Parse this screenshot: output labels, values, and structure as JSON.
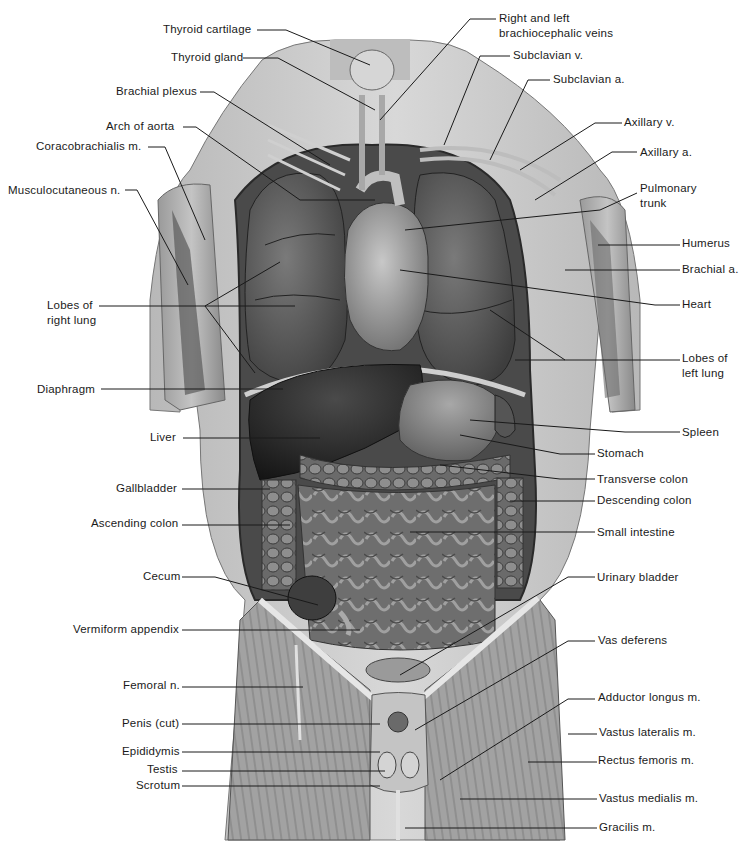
{
  "figure": {
    "type": "anatomical illustration",
    "colors": {
      "background": "#ffffff",
      "skin": "#d4d4d4",
      "muscle": "#8a8a8a",
      "organ_dark": "#3a3a3a",
      "lung": "#5e5e5e",
      "intestine": "#7a7a7a",
      "leader_line": "#1a1a1a",
      "label_text": "#1a1a1a"
    }
  },
  "labels_left": [
    {
      "id": "thyroid-cartilage",
      "text": "Thyroid cartilage",
      "x": 163,
      "y": 24
    },
    {
      "id": "thyroid-gland",
      "text": "Thyroid gland",
      "x": 171,
      "y": 52
    },
    {
      "id": "brachial-plexus",
      "text": "Brachial plexus",
      "x": 116,
      "y": 86
    },
    {
      "id": "arch-of-aorta",
      "text": "Arch of aorta",
      "x": 106,
      "y": 121
    },
    {
      "id": "coracobrachialis",
      "text": "Coracobrachialis m.",
      "x": 36,
      "y": 140
    },
    {
      "id": "musculocutaneous",
      "text": "Musculocutaneous n.",
      "x": 8,
      "y": 184
    },
    {
      "id": "lobes-right-lung",
      "text": "Lobes of\nright lung",
      "x": 47,
      "y": 299
    },
    {
      "id": "diaphragm",
      "text": "Diaphragm",
      "x": 37,
      "y": 383
    },
    {
      "id": "liver",
      "text": "Liver",
      "x": 150,
      "y": 430
    },
    {
      "id": "gallbladder",
      "text": "Gallbladder",
      "x": 116,
      "y": 482
    },
    {
      "id": "ascending-colon",
      "text": "Ascending colon",
      "x": 91,
      "y": 517
    },
    {
      "id": "cecum",
      "text": "Cecum",
      "x": 143,
      "y": 570
    },
    {
      "id": "vermiform-appendix",
      "text": "Vermiform appendix",
      "x": 73,
      "y": 622
    },
    {
      "id": "femoral-n",
      "text": "Femoral n.",
      "x": 123,
      "y": 678
    },
    {
      "id": "penis-cut",
      "text": "Penis (cut)",
      "x": 122,
      "y": 716
    },
    {
      "id": "epididymis",
      "text": "Epididymis",
      "x": 122,
      "y": 744
    },
    {
      "id": "testis",
      "text": "Testis",
      "x": 147,
      "y": 762
    },
    {
      "id": "scrotum",
      "text": "Scrotum",
      "x": 136,
      "y": 778
    }
  ],
  "labels_right": [
    {
      "id": "brachiocephalic-veins",
      "text": "Right and left\nbrachiocephalic veins",
      "x": 499,
      "y": 12
    },
    {
      "id": "subclavian-v",
      "text": "Subclavian v.",
      "x": 513,
      "y": 48
    },
    {
      "id": "subclavian-a",
      "text": "Subclavian a.",
      "x": 553,
      "y": 72
    },
    {
      "id": "axillary-v",
      "text": "Axillary v.",
      "x": 624,
      "y": 115
    },
    {
      "id": "axillary-a",
      "text": "Axillary a.",
      "x": 640,
      "y": 144
    },
    {
      "id": "pulmonary-trunk",
      "text": "Pulmonary\ntrunk",
      "x": 640,
      "y": 181
    },
    {
      "id": "humerus",
      "text": "Humerus",
      "x": 682,
      "y": 236
    },
    {
      "id": "brachial-a",
      "text": "Brachial a.",
      "x": 682,
      "y": 262
    },
    {
      "id": "heart",
      "text": "Heart",
      "x": 682,
      "y": 297
    },
    {
      "id": "lobes-left-lung",
      "text": "Lobes of\nleft lung",
      "x": 682,
      "y": 350
    },
    {
      "id": "spleen",
      "text": "Spleen",
      "x": 682,
      "y": 425
    },
    {
      "id": "stomach",
      "text": "Stomach",
      "x": 597,
      "y": 446
    },
    {
      "id": "transverse-colon",
      "text": "Transverse colon",
      "x": 597,
      "y": 472
    },
    {
      "id": "descending-colon",
      "text": "Descending colon",
      "x": 597,
      "y": 493
    },
    {
      "id": "small-intestine",
      "text": "Small intestine",
      "x": 597,
      "y": 525
    },
    {
      "id": "urinary-bladder",
      "text": "Urinary bladder",
      "x": 597,
      "y": 570
    },
    {
      "id": "vas-deferens",
      "text": "Vas deferens",
      "x": 598,
      "y": 633
    },
    {
      "id": "adductor-longus",
      "text": "Adductor longus m.",
      "x": 598,
      "y": 690
    },
    {
      "id": "vastus-lateralis",
      "text": "Vastus lateralis m.",
      "x": 599,
      "y": 725
    },
    {
      "id": "rectus-femoris",
      "text": "Rectus femoris m.",
      "x": 598,
      "y": 753
    },
    {
      "id": "vastus-medialis",
      "text": "Vastus medialis m.",
      "x": 599,
      "y": 791
    },
    {
      "id": "gracilis",
      "text": "Gracilis m.",
      "x": 599,
      "y": 820
    }
  ]
}
